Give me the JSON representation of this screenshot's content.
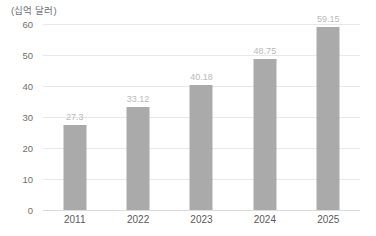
{
  "chart_data": {
    "type": "bar",
    "title": "",
    "subtitle": "",
    "unit_label": "(십억 달러)",
    "xlabel": "",
    "ylabel": "",
    "categories": [
      "2011",
      "2022",
      "2023",
      "2024",
      "2025"
    ],
    "values": [
      27.3,
      33.12,
      40.18,
      48.75,
      59.15
    ],
    "value_labels": [
      "27.3",
      "33.12",
      "40.18",
      "48.75",
      "59.15"
    ],
    "series": [
      {
        "name": "",
        "values": [
          27.3,
          33.12,
          40.18,
          48.75,
          59.15
        ]
      }
    ],
    "ylim": [
      0,
      60
    ],
    "yticks": [
      60,
      50,
      40,
      30,
      20,
      10,
      0
    ],
    "ytick_labels": [
      "60",
      "50",
      "40",
      "30",
      "20",
      "10",
      "0"
    ],
    "grid": true,
    "grid_axis": "y",
    "legend": false,
    "legend_position": "none",
    "bar_color": "#aaaaaa",
    "grid_color": "#e8e8e8",
    "axis_color": "#dcdcdc",
    "value_label_color": "#b9b9b9",
    "tick_label_color": "#6e6e6e",
    "background": "#ffffff"
  }
}
